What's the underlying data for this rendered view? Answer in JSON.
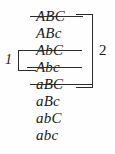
{
  "figure": {
    "type": "truth-table-enumeration",
    "background_color": "#fefefe",
    "ink_color": "#1a1a1a",
    "rule_color": "#2b2b2b",
    "rows": [
      {
        "text": "ABC",
        "struck": true,
        "top": 8,
        "strike_left": 30,
        "strike_width": 53
      },
      {
        "text": "ABc",
        "struck": false,
        "top": 25,
        "strike_left": 0,
        "strike_width": 0
      },
      {
        "text": "AbC",
        "struck": true,
        "top": 42,
        "strike_left": 27,
        "strike_width": 55
      },
      {
        "text": "Abc",
        "struck": true,
        "top": 59,
        "strike_left": 27,
        "strike_width": 55
      },
      {
        "text": "aBC",
        "struck": true,
        "top": 76,
        "strike_left": 30,
        "strike_width": 63
      },
      {
        "text": "aBc",
        "struck": false,
        "top": 93,
        "strike_left": 0,
        "strike_width": 0
      },
      {
        "text": "abC",
        "struck": false,
        "top": 110,
        "strike_left": 0,
        "strike_width": 0
      },
      {
        "text": "abc",
        "struck": false,
        "top": 127,
        "strike_left": 0,
        "strike_width": 0
      }
    ],
    "brackets": [
      {
        "name": "left",
        "label": "1",
        "spans_rows": [
          3,
          4
        ],
        "side": "left"
      },
      {
        "name": "right",
        "label": "2",
        "spans_rows": [
          1,
          2,
          3,
          4,
          5
        ],
        "side": "right"
      }
    ]
  }
}
